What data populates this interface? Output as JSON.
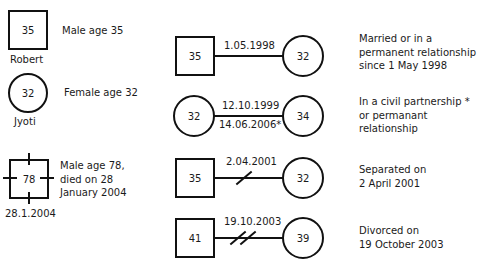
{
  "legend": {
    "male": {
      "age": "35",
      "name": "Robert",
      "description": "Male age 35"
    },
    "female": {
      "age": "32",
      "name": "Jyoti",
      "description": "Female age 32"
    },
    "deceased": {
      "age": "78",
      "date": "28.1.2004",
      "description_lines": [
        "Male age 78,",
        "died on 28",
        "January 2004"
      ]
    }
  },
  "relationships": [
    {
      "type": "married",
      "left": {
        "shape": "square",
        "age": "35"
      },
      "right": {
        "shape": "circle",
        "age": "32"
      },
      "date_above": "1.05.1998",
      "description_lines": [
        "Married or in a",
        "permanent relationship",
        "since 1 May 1998"
      ]
    },
    {
      "type": "civil-partnership",
      "left": {
        "shape": "circle",
        "age": "32"
      },
      "right": {
        "shape": "circle",
        "age": "34"
      },
      "date_above": "12.10.1999",
      "date_below": "14.06.2006*",
      "description_lines": [
        "In a civil partnership *",
        "or permanant",
        "relationship"
      ]
    },
    {
      "type": "separated",
      "left": {
        "shape": "square",
        "age": "35"
      },
      "right": {
        "shape": "circle",
        "age": "32"
      },
      "date_above": "2.04.2001",
      "description_lines": [
        "Separated on",
        "2 April 2001"
      ]
    },
    {
      "type": "divorced",
      "left": {
        "shape": "square",
        "age": "41"
      },
      "right": {
        "shape": "circle",
        "age": "39"
      },
      "date_above": "19.10.2003",
      "description_lines": [
        "Divorced on",
        "19 October 2003"
      ]
    }
  ]
}
